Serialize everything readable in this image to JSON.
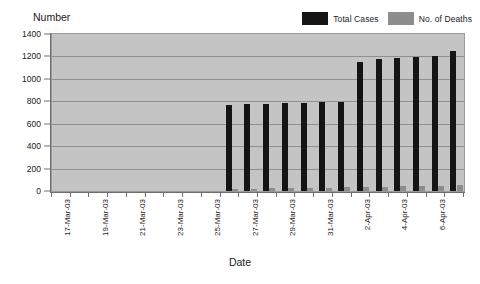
{
  "chart_data": {
    "type": "bar",
    "title": "",
    "ylabel": "Number",
    "xlabel": "Date",
    "ylim": [
      0,
      1400
    ],
    "ytick_step": 200,
    "yticks": [
      0,
      200,
      400,
      600,
      800,
      1000,
      1200,
      1400
    ],
    "grid": true,
    "legend_position": "top-right",
    "categories": [
      "17-Mar-03",
      "18-Mar-03",
      "19-Mar-03",
      "20-Mar-03",
      "21-Mar-03",
      "22-Mar-03",
      "23-Mar-03",
      "24-Mar-03",
      "25-Mar-03",
      "26-Mar-03",
      "27-Mar-03",
      "28-Mar-03",
      "29-Mar-03",
      "30-Mar-03",
      "31-Mar-03",
      "1-Apr-03",
      "2-Apr-03",
      "3-Apr-03",
      "4-Apr-03",
      "5-Apr-03",
      "6-Apr-03",
      "7-Apr-03"
    ],
    "tick_labels": [
      "17-Mar-03",
      "",
      "19-Mar-03",
      "",
      "21-Mar-03",
      "",
      "23-Mar-03",
      "",
      "25-Mar-03",
      "",
      "27-Mar-03",
      "",
      "29-Mar-03",
      "",
      "31-Mar-03",
      "",
      "2-Apr-03",
      "",
      "4-Apr-03",
      "",
      "6-Apr-03",
      ""
    ],
    "series": [
      {
        "name": "Total Cases",
        "color": "#151515",
        "values": [
          0,
          0,
          0,
          0,
          0,
          0,
          0,
          0,
          0,
          770,
          775,
          780,
          785,
          785,
          790,
          795,
          1150,
          1180,
          1190,
          1195,
          1200,
          1250
        ]
      },
      {
        "name": "No. of Deaths",
        "color": "#8d8d8d",
        "values": [
          0,
          0,
          0,
          0,
          0,
          0,
          0,
          0,
          0,
          20,
          22,
          24,
          26,
          28,
          30,
          32,
          38,
          40,
          42,
          44,
          46,
          50
        ]
      }
    ]
  },
  "legend": {
    "entries": [
      {
        "label": "Total Cases",
        "color": "#151515"
      },
      {
        "label": "No. of Deaths",
        "color": "#8d8d8d"
      }
    ]
  },
  "axis_titles": {
    "y": "Number",
    "x": "Date"
  }
}
